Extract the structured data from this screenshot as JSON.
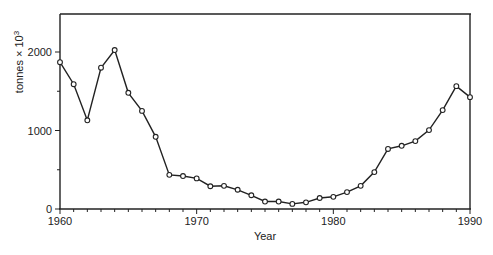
{
  "chart_data": {
    "type": "line",
    "title": "",
    "xlabel": "Year",
    "ylabel": "tonnes × 10",
    "ylabel_superscript": "3",
    "xlim": [
      1960,
      1990
    ],
    "ylim": [
      0,
      2500
    ],
    "xticks_major": [
      1960,
      1970,
      1980,
      1990
    ],
    "xticks_minor_step": 1,
    "yticks_major": [
      0,
      1000,
      2000
    ],
    "yticks_minor_step": 500,
    "grid": false,
    "legend": null,
    "marker": "open-circle",
    "x": [
      1960,
      1961,
      1962,
      1963,
      1964,
      1965,
      1966,
      1967,
      1968,
      1969,
      1970,
      1971,
      1972,
      1973,
      1974,
      1975,
      1976,
      1977,
      1978,
      1979,
      1980,
      1981,
      1982,
      1983,
      1984,
      1985,
      1986,
      1987,
      1988,
      1989,
      1990
    ],
    "series": [
      {
        "name": "catch",
        "values": [
          1870,
          1590,
          1130,
          1800,
          2025,
          1480,
          1250,
          920,
          435,
          420,
          390,
          290,
          295,
          245,
          175,
          95,
          95,
          65,
          85,
          140,
          155,
          215,
          295,
          470,
          765,
          805,
          865,
          1005,
          1260,
          1565,
          1425
        ]
      }
    ]
  },
  "axes": {
    "x_tick_labels": [
      "1960",
      "1970",
      "1980",
      "1990"
    ],
    "y_tick_labels": [
      "0",
      "1000",
      "2000"
    ],
    "x_title": "Year",
    "y_title": "tonnes × 10",
    "y_title_sup": "3"
  }
}
